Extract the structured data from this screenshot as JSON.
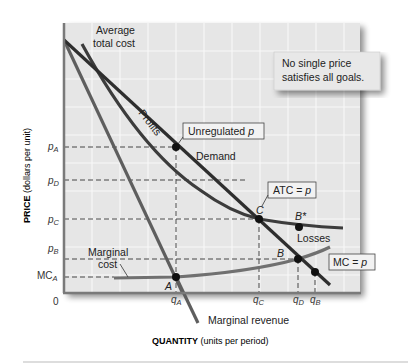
{
  "diagram": {
    "note_box": [
      "No single price",
      "satisfies all goals."
    ],
    "axes": {
      "y_label_bold": "PRICE",
      "y_label_rest": " (dollars per unit)",
      "x_label_bold": "QUANTITY",
      "x_label_rest": " (units per period)",
      "origin": "0"
    },
    "y_ticks": [
      {
        "main": "p",
        "sub": "A"
      },
      {
        "main": "p",
        "sub": "D"
      },
      {
        "main": "p",
        "sub": "C"
      },
      {
        "main": "p",
        "sub": "B"
      },
      {
        "main": "MC",
        "sub": "A"
      }
    ],
    "x_ticks": [
      {
        "main": "q",
        "sub": "A"
      },
      {
        "main": "q",
        "sub": "C"
      },
      {
        "main": "q",
        "sub": "D"
      },
      {
        "main": "q",
        "sub": "B"
      }
    ],
    "curve_labels": {
      "atc_line1": "Average",
      "atc_line2": "total cost",
      "demand": "Demand",
      "mc_line1": "Marginal",
      "mc_line2": "cost",
      "mr": "Marginal revenue",
      "profits": "Profits",
      "losses": "Losses"
    },
    "callouts": {
      "unregulated": "Unregulated ",
      "unregulated_p": "p",
      "atc_eq": "ATC = ",
      "atc_eq_p": "p",
      "mc_eq": "MC = ",
      "mc_eq_p": "p"
    },
    "points": {
      "A": "A",
      "B": "B",
      "B_star": "B*",
      "C": "C"
    },
    "colors": {
      "plot_bg": "#e6e6e6",
      "grid": "#f7f7f7",
      "demand": "#2e2e2e",
      "atc": "#3c3c3c",
      "mr": "#5e5e5e",
      "mc": "#707070",
      "axis": "#7a7a7a"
    }
  }
}
